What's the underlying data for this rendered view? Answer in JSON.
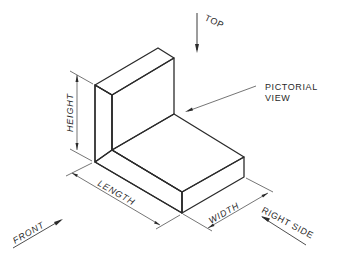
{
  "diagram": {
    "type": "isometric-pictorial-view",
    "object": "L-shaped block",
    "labels": {
      "top": "TOP",
      "front": "FRONT",
      "right_side": "RIGHT SIDE",
      "pictorial_view_line1": "PICTORIAL",
      "pictorial_view_line2": "VIEW"
    },
    "dimensions": {
      "height": "HEIGHT",
      "length": "LENGTH",
      "width": "WIDTH"
    },
    "colors": {
      "face_top": "#e9e9e9",
      "face_front": "#e4e4e4",
      "face_side": "#dedede",
      "line": "#2b2b2b"
    }
  }
}
